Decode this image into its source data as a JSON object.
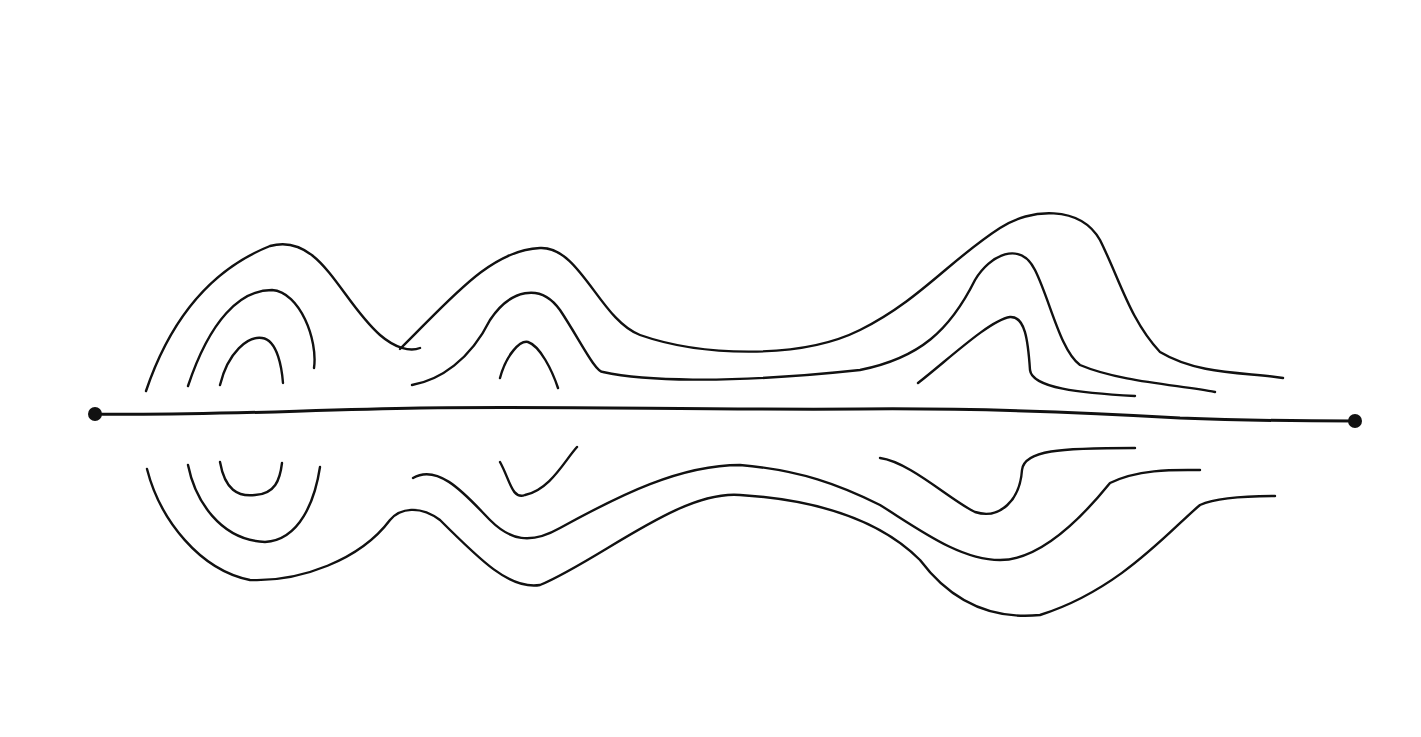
{
  "diagram": {
    "type": "hand-drawn contour / field-line sketch",
    "background": "#ffffff",
    "ink_color": "#111111",
    "axis": {
      "path": "M95,414 C200,416 300,410 420,408 C560,406 700,410 860,409 C980,408 1080,412 1180,418 C1260,421 1320,421 1355,421",
      "endpoints": [
        {
          "cx": 95,
          "cy": 414,
          "r": 7
        },
        {
          "cx": 1355,
          "cy": 421,
          "r": 7
        }
      ]
    },
    "upper_lines": [
      "M146,391 C170,320 210,270 270,246 C320,232 340,300 380,335 C395,348 410,352 420,348",
      "M188,386 C210,320 240,290 272,290 C300,292 318,340 314,368",
      "M220,385 C228,352 248,336 262,338 C278,340 282,370 283,383",
      "M400,349 C450,300 490,250 540,248 C580,246 600,320 640,335 C700,356 800,360 860,330 C920,300 950,260 1000,228 C1030,208 1080,205 1100,240 C1120,280 1130,320 1160,352 C1200,376 1250,372 1283,378",
      "M412,385 C440,380 470,360 490,320 C510,290 540,282 560,310 C580,340 595,372 603,372 C640,380 720,385 860,370 C920,358 950,330 975,280 C990,255 1020,240 1035,270 C1050,300 1060,350 1080,365 C1120,382 1180,385 1215,392",
      "M500,378 C506,355 520,340 528,342 C540,346 552,370 558,388",
      "M918,383 C950,358 990,320 1010,317 C1025,316 1028,340 1030,370 C1032,388 1080,393 1135,396"
    ],
    "lower_lines": [
      "M147,469 C160,520 200,570 250,580 C300,582 360,560 390,520 C400,508 420,505 440,520 C480,560 510,590 540,585 C600,560 680,490 740,495 C820,500 880,520 920,560 C950,600 990,620 1040,615 C1120,590 1170,530 1200,505 C1220,496 1260,496 1275,496",
      "M188,465 C195,500 220,540 265,542 C300,540 315,500 320,467",
      "M220,462 C225,490 238,497 255,495 C275,494 280,480 282,463",
      "M413,478 C440,462 470,500 490,520 C510,540 530,545 560,528 C620,495 680,465 740,465 C800,470 840,485 880,505 C920,530 960,560 1000,560 C1040,560 1080,520 1110,483 C1140,468 1180,470 1200,470",
      "M500,462 C510,480 512,500 525,495 C550,490 565,460 577,447",
      "M880,458 C910,462 950,500 975,512 C1000,520 1020,500 1022,470 C1024,450 1060,448 1135,448"
    ]
  }
}
